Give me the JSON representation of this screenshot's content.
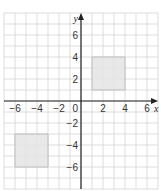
{
  "chart_data": {
    "type": "scatter",
    "title": "",
    "xlabel": "x",
    "ylabel": "y",
    "xlim": [
      -7,
      7
    ],
    "ylim": [
      -8,
      8
    ],
    "grid": true,
    "x_ticks": [
      -6,
      -4,
      -2,
      0,
      2,
      4,
      6
    ],
    "y_ticks": [
      6,
      4,
      2,
      -2,
      -4,
      -6
    ],
    "shapes": [
      {
        "name": "square A",
        "type": "square",
        "vertices": [
          [
            1,
            1
          ],
          [
            4,
            1
          ],
          [
            4,
            4
          ],
          [
            1,
            4
          ]
        ],
        "fill": "#e6e6e6"
      },
      {
        "name": "square B",
        "type": "square",
        "vertices": [
          [
            -6,
            -3
          ],
          [
            -3,
            -3
          ],
          [
            -3,
            -6
          ],
          [
            -6,
            -6
          ]
        ],
        "fill": "#e6e6e6"
      }
    ]
  },
  "colors": {
    "grid": "#d4d4d4",
    "axis": "#222222",
    "shape_fill": "#e6e6e6",
    "shape_stroke": "#b8b8b8"
  },
  "labels": {
    "x_axis": "x",
    "y_axis": "y",
    "origin": "0"
  }
}
